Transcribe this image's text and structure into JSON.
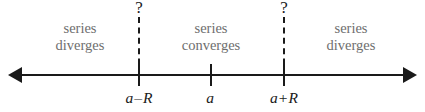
{
  "figure": {
    "colors": {
      "axis": "#1a1a1a",
      "region_text": "#6e6e6e",
      "point_label": "#1a1a1a",
      "background": "#ffffff"
    }
  },
  "axis": {
    "left_arrow": "left-arrow",
    "right_arrow": "right-arrow"
  },
  "regions": [
    {
      "line1": "series",
      "line2": "diverges"
    },
    {
      "line1": "series",
      "line2": "converges"
    },
    {
      "line1": "series",
      "line2": "diverges"
    }
  ],
  "boundaries": [
    {
      "marker": "?"
    },
    {
      "marker": "?"
    }
  ],
  "points": [
    {
      "base": "a",
      "op": "–",
      "term": "R"
    },
    {
      "base": "a",
      "op": "",
      "term": ""
    },
    {
      "base": "a",
      "op": "+",
      "term": "R"
    }
  ]
}
